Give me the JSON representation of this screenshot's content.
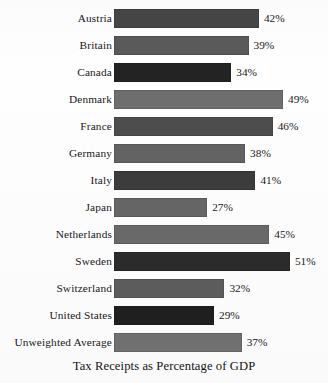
{
  "chart_data": {
    "type": "bar",
    "orientation": "horizontal",
    "title": "Tax Receipts as Percentage of GDP",
    "xlabel": "",
    "ylabel": "",
    "xlim": [
      0,
      51
    ],
    "grid": false,
    "legend": false,
    "value_suffix": "%",
    "categories": [
      "Austria",
      "Britain",
      "Canada",
      "Denmark",
      "France",
      "Germany",
      "Italy",
      "Japan",
      "Netherlands",
      "Sweden",
      "Switzerland",
      "United States",
      "Unweighted Average"
    ],
    "values": [
      42,
      39,
      34,
      49,
      46,
      38,
      41,
      27,
      45,
      51,
      32,
      29,
      37
    ],
    "value_labels": [
      "42%",
      "39%",
      "34%",
      "49%",
      "46%",
      "38%",
      "41%",
      "27%",
      "45%",
      "51%",
      "32%",
      "29%",
      "37%"
    ],
    "bar_colors": [
      "#464646",
      "#5a5a5a",
      "#232323",
      "#6e6e6e",
      "#4d4d4d",
      "#636363",
      "#3c3c3c",
      "#666666",
      "#6a6a6a",
      "#2b2b2b",
      "#5d5d5d",
      "#1f1f1f",
      "#727272"
    ],
    "background_color": "#ffffff",
    "text_color": "#18181a"
  }
}
